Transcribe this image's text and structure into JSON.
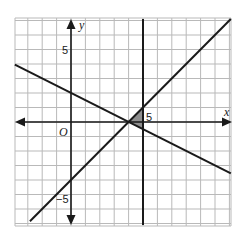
{
  "figure": {
    "axis_labels": {
      "x": "x",
      "y": "y",
      "origin": "O"
    },
    "tick_labels": {
      "x_pos": "5",
      "y_pos": "5",
      "y_neg": "−5"
    },
    "colors": {
      "grid": "#b9b9b9",
      "lines": "#1a1a1a",
      "shade": "#7a7a7a"
    }
  },
  "chart_data": {
    "type": "line",
    "title": "",
    "xlabel": "x",
    "ylabel": "y",
    "xlim": [
      -3.9,
      11.1
    ],
    "ylim": [
      -7.2,
      7.2
    ],
    "grid": true,
    "series": [
      {
        "name": "y = x - 4",
        "x": [
          -2.85,
          11.1
        ],
        "y": [
          -6.85,
          7.1
        ]
      },
      {
        "name": "y = -0.5x + 2",
        "x": [
          -3.9,
          11.1
        ],
        "y": [
          3.95,
          -3.55
        ]
      },
      {
        "name": "x = 5",
        "x": [
          5,
          5
        ],
        "y": [
          -7.2,
          7.2
        ]
      }
    ],
    "shaded_region": {
      "vertices": [
        [
          4,
          0
        ],
        [
          5,
          1
        ],
        [
          5,
          -0.5
        ]
      ]
    },
    "tick_labels": {
      "x": [
        "5"
      ],
      "y": [
        "5",
        "-5"
      ]
    },
    "annotations": [
      "O"
    ]
  }
}
